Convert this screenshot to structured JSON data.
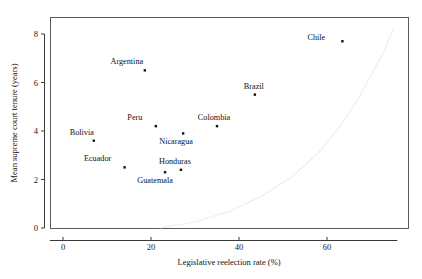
{
  "chart_data": {
    "type": "scatter",
    "title": "",
    "xlabel": "Legislative reelection rate (%)",
    "ylabel": "Mean supreme court tenure (years)",
    "xlim": [
      -3,
      76
    ],
    "ylim": [
      -0.35,
      8.45
    ],
    "xticks": [
      0,
      20,
      40,
      60
    ],
    "xticklabels": [
      "0",
      "20",
      "40",
      "60"
    ],
    "yticks": [
      0,
      2,
      4,
      6,
      8
    ],
    "yticklabels": [
      "0",
      "2",
      "4",
      "6",
      "8"
    ],
    "grid": false,
    "legend": false,
    "points": [
      {
        "label": "Chile",
        "x": 63.5,
        "y": 7.7,
        "label_dx": -26,
        "label_dy": -1
      },
      {
        "label": "Argentina",
        "x": 18.6,
        "y": 6.5,
        "label_dx": -18,
        "label_dy": -6
      },
      {
        "label": "Brazil",
        "x": 43.6,
        "y": 5.5,
        "label_dx": -1,
        "label_dy": -6
      },
      {
        "label": "Colombia",
        "x": 35.0,
        "y": 4.2,
        "label_dx": -3,
        "label_dy": -6
      },
      {
        "label": "Peru",
        "x": 21.1,
        "y": 4.2,
        "label_dx": -21,
        "label_dy": -6
      },
      {
        "label": "Nicaragua",
        "x": 27.3,
        "y": 3.9,
        "label_dx": -7,
        "label_dy": 11
      },
      {
        "label": "Bolivia",
        "x": 7.0,
        "y": 3.6,
        "label_dx": -12,
        "label_dy": -6
      },
      {
        "label": "Ecuador",
        "x": 14.0,
        "y": 2.5,
        "label_dx": -27,
        "label_dy": -6
      },
      {
        "label": "Honduras",
        "x": 26.8,
        "y": 2.4,
        "label_dx": -6,
        "label_dy": -6
      },
      {
        "label": "Guatemala",
        "x": 23.2,
        "y": 2.3,
        "label_dx": -10,
        "label_dy": 11
      }
    ],
    "fit_curve": {
      "description": "faint light-gray exponential trend curve",
      "color": "#ededed",
      "x": [
        22,
        30,
        38,
        45,
        52,
        58,
        63,
        67,
        70,
        73,
        75
      ],
      "y": [
        0.0,
        0.25,
        0.7,
        1.3,
        2.1,
        3.1,
        4.2,
        5.3,
        6.3,
        7.3,
        8.2
      ]
    }
  },
  "axes": {
    "x_title": "Legislative reelection rate (%)",
    "y_title": "Mean supreme court tenure (years)"
  }
}
